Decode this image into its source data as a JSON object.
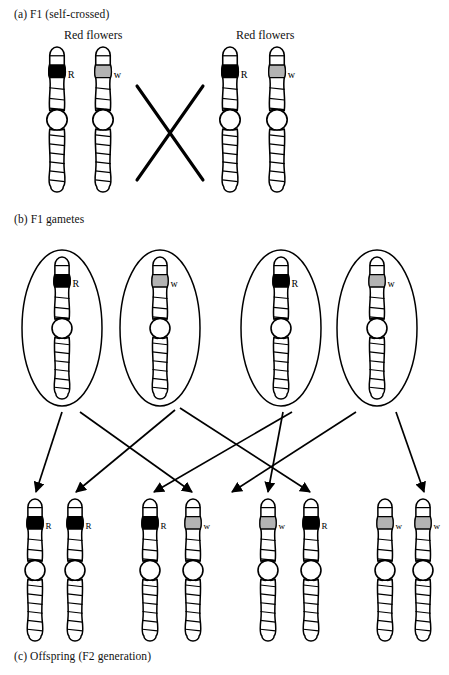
{
  "figure": {
    "type": "genetics-punnett-cross-diagram",
    "title_parts": {
      "panel_a": "(a) F1 (self-crossed)",
      "panel_b": "(b) F1 gametes",
      "panel_c": "(c) Offspring (F2 generation)"
    },
    "colors": {
      "allele_R_band": "#000000",
      "allele_w_band": "#b3b3b3",
      "outline": "#000000",
      "background": "#ffffff"
    },
    "allele_labels": {
      "dominant": "R",
      "recessive": "w"
    }
  },
  "panel_a": {
    "label": "(a) F1 (self-crossed)",
    "parents": [
      {
        "phenotype_label": "Red flowers",
        "label_x": 105,
        "chromosomes": [
          {
            "allele": "R",
            "band": "black",
            "x": 57,
            "y": 48
          },
          {
            "allele": "w",
            "band": "gray",
            "x": 103,
            "y": 48
          }
        ]
      },
      {
        "phenotype_label": "Red flowers",
        "label_x": 278,
        "chromosomes": [
          {
            "allele": "R",
            "band": "black",
            "x": 230,
            "y": 48
          },
          {
            "allele": "w",
            "band": "gray",
            "x": 277,
            "y": 48
          }
        ]
      }
    ],
    "cross_mark": {
      "name": "self-cross-x",
      "x1": 137,
      "y1": 86,
      "x2": 203,
      "y2": 180
    }
  },
  "panel_b": {
    "label": "(b) F1 gametes",
    "gametes": [
      {
        "index": 1,
        "allele": "R",
        "band": "black",
        "cx": 62,
        "cy": 328,
        "rx": 40,
        "ry": 78
      },
      {
        "index": 2,
        "allele": "w",
        "band": "gray",
        "cx": 160,
        "cy": 328,
        "rx": 40,
        "ry": 78
      },
      {
        "index": 3,
        "allele": "R",
        "band": "black",
        "cx": 281,
        "cy": 328,
        "rx": 40,
        "ry": 78
      },
      {
        "index": 4,
        "allele": "w",
        "band": "gray",
        "cx": 377,
        "cy": 328,
        "rx": 40,
        "ry": 78
      }
    ]
  },
  "panel_c": {
    "label": "(c) Offspring (F2 generation)",
    "offspring": [
      {
        "index": 1,
        "allele": "R",
        "band": "black",
        "x": 35,
        "y": 500,
        "pair": 1
      },
      {
        "index": 2,
        "allele": "R",
        "band": "black",
        "x": 75,
        "y": 500,
        "pair": 1
      },
      {
        "index": 3,
        "allele": "R",
        "band": "black",
        "x": 150,
        "y": 500,
        "pair": 2
      },
      {
        "index": 4,
        "allele": "w",
        "band": "gray",
        "x": 193,
        "y": 500,
        "pair": 2
      },
      {
        "index": 5,
        "allele": "w",
        "band": "gray",
        "x": 268,
        "y": 500,
        "pair": 3
      },
      {
        "index": 6,
        "allele": "R",
        "band": "black",
        "x": 311,
        "y": 500,
        "pair": 3
      },
      {
        "index": 7,
        "allele": "w",
        "band": "gray",
        "x": 385,
        "y": 500,
        "pair": 4
      },
      {
        "index": 8,
        "allele": "w",
        "band": "gray",
        "x": 423,
        "y": 500,
        "pair": 4
      }
    ],
    "genotypes": [
      "RR",
      "Rw",
      "wR",
      "ww"
    ]
  },
  "arrows": [
    {
      "name": "gamete1-to-offspring1",
      "from_gamete": 1,
      "to_offspring": 1,
      "x1": 62,
      "y1": 412,
      "x2": 36,
      "y2": 492
    },
    {
      "name": "gamete1-to-offspring4",
      "from_gamete": 1,
      "to_offspring": 4,
      "x1": 80,
      "y1": 412,
      "x2": 192,
      "y2": 492
    },
    {
      "name": "gamete2-to-offspring2",
      "from_gamete": 2,
      "to_offspring": 2,
      "x1": 175,
      "y1": 410,
      "x2": 76,
      "y2": 492
    },
    {
      "name": "gamete2-to-offspring6",
      "from_gamete": 2,
      "to_offspring": 6,
      "x1": 180,
      "y1": 408,
      "x2": 310,
      "y2": 492
    },
    {
      "name": "gamete3-to-offspring3",
      "from_gamete": 3,
      "to_offspring": 3,
      "x1": 292,
      "y1": 412,
      "x2": 154,
      "y2": 492
    },
    {
      "name": "gamete3-to-offspring5",
      "from_gamete": 3,
      "to_offspring": 5,
      "x1": 283,
      "y1": 412,
      "x2": 268,
      "y2": 492
    },
    {
      "name": "gamete4-to-offspring7",
      "from_gamete": 4,
      "to_offspring": 7,
      "x1": 356,
      "y1": 412,
      "x2": 232,
      "y2": 492
    },
    {
      "name": "gamete4-to-offspring8",
      "from_gamete": 4,
      "to_offspring": 8,
      "x1": 396,
      "y1": 412,
      "x2": 424,
      "y2": 492
    }
  ]
}
